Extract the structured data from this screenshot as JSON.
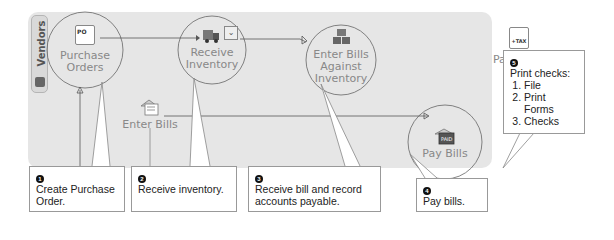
{
  "diagram": {
    "tab": {
      "label": "Vendors",
      "icon": "vendor-book-icon"
    },
    "nodes": [
      {
        "id": "purchase_orders",
        "label_line1": "Purchase",
        "label_line2": "Orders",
        "icon": "po-form-icon",
        "icon_text": "PO"
      },
      {
        "id": "receive_inventory",
        "label_line1": "Receive",
        "label_line2": "Inventory",
        "icon": "truck-icon"
      },
      {
        "id": "enter_bills_against_inventory",
        "label_line1": "Enter Bills",
        "label_line2": "Against",
        "label_line3": "Inventory",
        "icon": "boxes-icon"
      },
      {
        "id": "enter_bills",
        "label_line1": "Enter Bills",
        "icon": "bill-envelope-icon"
      },
      {
        "id": "pay_bills",
        "label_line1": "Pay Bills",
        "icon": "paid-envelope-icon",
        "icon_text": "PAID"
      },
      {
        "id": "pay_sales_tax",
        "label_line1": "Pay Sales",
        "label_line2": "Tax",
        "icon": "tax-form-icon",
        "icon_text": "+TAX"
      }
    ],
    "callouts": [
      {
        "number": "1",
        "text": "Create Purchase Order."
      },
      {
        "number": "2",
        "text": "Receive inventory."
      },
      {
        "number": "3",
        "text": "Receive bill and record accounts payable."
      },
      {
        "number": "4",
        "text": "Pay bills."
      },
      {
        "number": "5",
        "text": "Print checks:",
        "steps": [
          "File",
          "Print Forms",
          "Checks"
        ]
      }
    ],
    "colors": {
      "panel": "#e6e6e6",
      "line": "#555555",
      "node_text": "#888888",
      "callout_border": "#999999"
    }
  }
}
